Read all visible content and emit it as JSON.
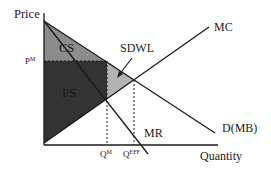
{
  "diagram": {
    "type": "monopoly-deadweight-loss",
    "axes": {
      "y_label": "Price",
      "x_label": "Quantity"
    },
    "curves": {
      "mc": "MC",
      "demand": "D(MB)",
      "mr": "MR"
    },
    "regions": {
      "cs": "CS",
      "ps": "PS",
      "sdwl": "SDWL"
    },
    "ticks": {
      "pm": {
        "base": "P",
        "sup": "M"
      },
      "qm": {
        "base": "Q",
        "sup": "M"
      },
      "qeff": {
        "base": "Q",
        "sup": "EFF"
      }
    },
    "colors": {
      "cs": "#8c8c8c",
      "ps": "#333333",
      "sdwl": "#b3b3b3",
      "line": "#1a1a1a"
    }
  }
}
